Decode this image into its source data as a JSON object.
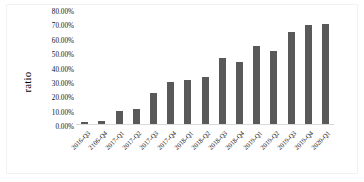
{
  "chart_data": {
    "type": "bar",
    "title": "",
    "xlabel": "",
    "ylabel": "ratio",
    "ylim": [
      0,
      80
    ],
    "ytick_labels": [
      "80.00%",
      "70.00%",
      "60.00%",
      "50.00%",
      "40.00%",
      "30.00%",
      "20.00%",
      "10.00%",
      "0.00%"
    ],
    "ytick_values": [
      80,
      70,
      60,
      50,
      40,
      30,
      20,
      10,
      0
    ],
    "grid": false,
    "legend": "none",
    "bar_color": "#595959",
    "categories": [
      "2016-Q3",
      "2106-Q4",
      "2017-Q1",
      "2017-Q2",
      "2017-Q3",
      "2017-Q4",
      "2018-Q1",
      "2018-Q2",
      "2018-Q3",
      "2018-Q4",
      "2019-Q1",
      "2019-Q2",
      "2019-Q3",
      "2019-Q4",
      "2020-Q1"
    ],
    "values": [
      1.5,
      2.5,
      10.0,
      11.0,
      23.5,
      31.5,
      33.0,
      35.5,
      49.5,
      46.0,
      58.0,
      54.5,
      68.5,
      74.0,
      74.5
    ],
    "value_labels": [
      "1.50%",
      "2.50%",
      "10.00%",
      "11.00%",
      "23.50%",
      "31.50%",
      "33.00%",
      "35.50%",
      "49.50%",
      "46.00%",
      "58.00%",
      "54.50%",
      "68.50%",
      "74.00%",
      "74.50%"
    ]
  }
}
